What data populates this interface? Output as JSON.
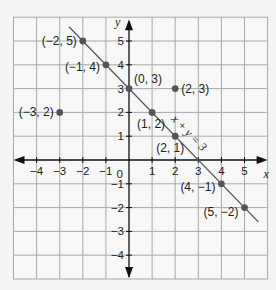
{
  "chart_data": {
    "type": "scatter",
    "title": "",
    "xlabel": "x",
    "ylabel": "y",
    "xlim": [
      -5,
      6
    ],
    "ylim": [
      -5,
      6
    ],
    "grid": true,
    "x_ticks": [
      -4,
      -3,
      -2,
      -1,
      0,
      1,
      2,
      3,
      4,
      5
    ],
    "y_ticks": [
      -4,
      -3,
      -2,
      -1,
      1,
      2,
      3,
      4,
      5
    ],
    "origin_label": "0",
    "line": {
      "equation": "x + y = 3",
      "from": [
        -2.6,
        5.6
      ],
      "to": [
        5.6,
        -2.6
      ]
    },
    "points": [
      {
        "label": "(−2, 5)",
        "x": -2,
        "y": 5,
        "on_line": true
      },
      {
        "label": "(−1, 4)",
        "x": -1,
        "y": 4,
        "on_line": true
      },
      {
        "label": "(0, 3)",
        "x": 0,
        "y": 3,
        "on_line": true
      },
      {
        "label": "(1, 2)",
        "x": 1,
        "y": 2,
        "on_line": true
      },
      {
        "label": "(2, 1)",
        "x": 2,
        "y": 1,
        "on_line": true
      },
      {
        "label": "(4, −1)",
        "x": 4,
        "y": -1,
        "on_line": true
      },
      {
        "label": "(5, −2)",
        "x": 5,
        "y": -2,
        "on_line": true
      },
      {
        "label": "(2, 3)",
        "x": 2,
        "y": 3,
        "on_line": false
      },
      {
        "label": "(−3, 2)",
        "x": -3,
        "y": 2,
        "on_line": false
      }
    ],
    "colors": {
      "background": "#f4f4f4",
      "grid": "#a8a8a8",
      "axis": "#111111",
      "line": "#555555",
      "point": "#555555"
    }
  }
}
